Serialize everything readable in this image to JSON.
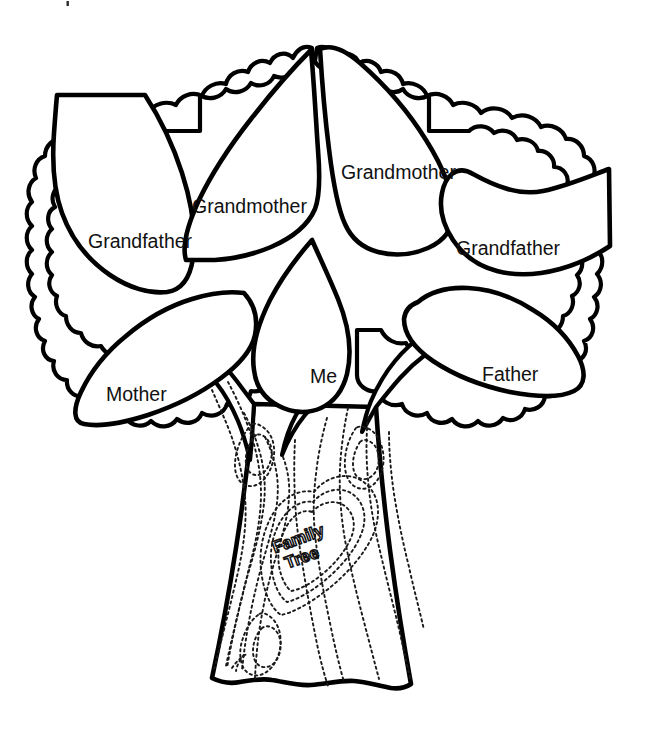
{
  "page": {
    "title": "Family Tree",
    "background_color": "#ffffff",
    "ink_color": "#000000",
    "width": 663,
    "height": 739
  },
  "tree": {
    "trunk_carving": {
      "shape": "heart",
      "line_1": "Family",
      "line_2": "Tree"
    },
    "leaves": [
      {
        "id": "grandfather-left",
        "label": "Grandfather",
        "label_x": 88,
        "label_y": 248,
        "generation": "grandparent",
        "side": "left"
      },
      {
        "id": "grandmother-left",
        "label": "Grandmother",
        "label_x": 192,
        "label_y": 213,
        "generation": "grandparent",
        "side": "left"
      },
      {
        "id": "grandmother-right",
        "label": "Grandmother",
        "label_x": 341,
        "label_y": 179,
        "generation": "grandparent",
        "side": "right"
      },
      {
        "id": "grandfather-right",
        "label": "Grandfather",
        "label_x": 456,
        "label_y": 255,
        "generation": "grandparent",
        "side": "right"
      },
      {
        "id": "mother",
        "label": "Mother",
        "label_x": 106,
        "label_y": 401,
        "generation": "parent",
        "side": "left"
      },
      {
        "id": "me",
        "label": "Me",
        "label_x": 310,
        "label_y": 383,
        "generation": "self",
        "side": "center"
      },
      {
        "id": "father",
        "label": "Father",
        "label_x": 482,
        "label_y": 381,
        "generation": "parent",
        "side": "right"
      }
    ]
  }
}
